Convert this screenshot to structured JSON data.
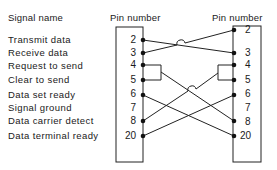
{
  "headers": {
    "signal_name": "Signal name",
    "left_pin_number": "Pin number",
    "right_pin_number": "Pin number"
  },
  "signals": [
    {
      "name": "Transmit data",
      "pin": "2"
    },
    {
      "name": "Receive data",
      "pin": "3"
    },
    {
      "name": "Request to send",
      "pin": "4"
    },
    {
      "name": "Clear to send",
      "pin": "5"
    },
    {
      "name": "Data set ready",
      "pin": "6"
    },
    {
      "name": "Signal ground",
      "pin": "7"
    },
    {
      "name": "Data carrier detect",
      "pin": "8"
    },
    {
      "name": "Data terminal ready",
      "pin": "20"
    }
  ],
  "right_pins": [
    "2",
    "3",
    "4",
    "5",
    "6",
    "7",
    "8",
    "20"
  ],
  "connections": [
    {
      "from": "L2",
      "to": "R3"
    },
    {
      "from": "L3",
      "to": "R2"
    },
    {
      "from": "L4+L5",
      "to": "R8"
    },
    {
      "from": "R4+R5",
      "to": "L8"
    },
    {
      "from": "L6",
      "to": "R20"
    },
    {
      "from": "L20",
      "to": "R6"
    }
  ]
}
